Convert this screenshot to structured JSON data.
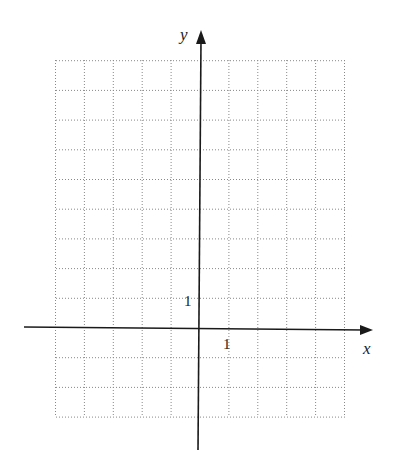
{
  "diagram": {
    "type": "coordinate-grid",
    "axes": {
      "x_label": "x",
      "y_label": "y",
      "x_tick_label": "1",
      "y_tick_label": "1"
    },
    "grid": {
      "x_min": -5,
      "x_max": 5,
      "y_min": -3,
      "y_max": 9,
      "style": "dotted",
      "unit_px_x": 28.9,
      "unit_px_y": 29.7,
      "origin_px": [
        200,
        328
      ],
      "left_px": 56,
      "right_px": 345,
      "top_px": 60,
      "bottom_px": 417
    },
    "colors": {
      "axis": "#1a1a1a",
      "grid": "#888888",
      "text": "#222222"
    }
  }
}
